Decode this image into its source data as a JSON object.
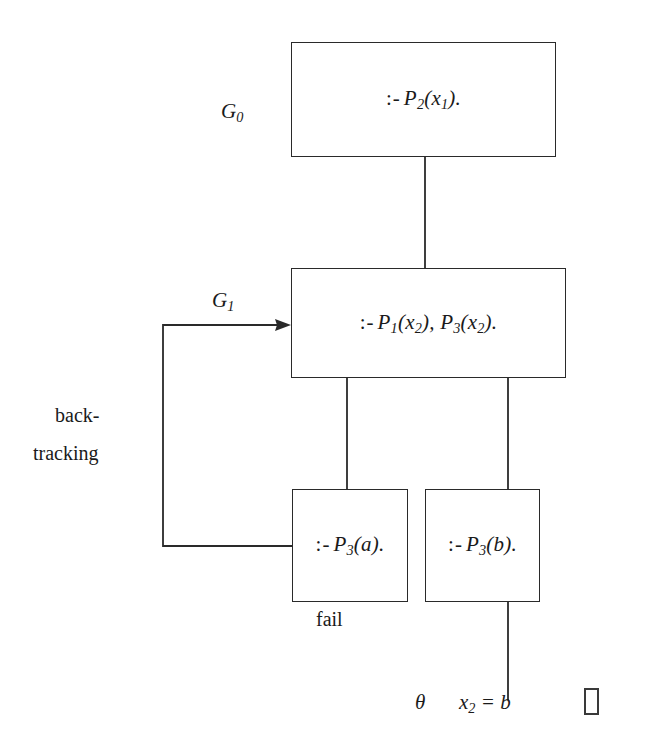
{
  "diagram": {
    "type": "sld-resolution-search-tree",
    "nodes": [
      {
        "id": "g0",
        "side_label": "G0",
        "side_label_base": "G",
        "side_label_sub": "0",
        "goal_op": ":-",
        "goal_body": "P2(x1).",
        "x": 291,
        "y": 42,
        "w": 265,
        "h": 115
      },
      {
        "id": "g1",
        "side_label": "G1",
        "side_label_base": "G",
        "side_label_sub": "1",
        "goal_op": ":-",
        "goal_body": "P1(x2), P3(x2).",
        "x": 291,
        "y": 268,
        "w": 275,
        "h": 110
      },
      {
        "id": "ga",
        "side_label": "",
        "goal_op": ":-",
        "goal_body": "P3(a).",
        "x": 292,
        "y": 489,
        "w": 116,
        "h": 113
      },
      {
        "id": "gb",
        "side_label": "",
        "goal_op": ":-",
        "goal_body": "P3(b).",
        "x": 425,
        "y": 489,
        "w": 115,
        "h": 113
      }
    ],
    "annotations": {
      "backtracking_line1": "back-",
      "backtracking_line2": "tracking",
      "fail": "fail",
      "theta": "θ",
      "substitution": "x2 = b",
      "box_glyph": "□"
    },
    "edges": [
      {
        "from": "g0",
        "to": "g1",
        "kind": "vertical"
      },
      {
        "from": "g1",
        "to": "ga",
        "kind": "vertical"
      },
      {
        "from": "g1",
        "to": "gb",
        "kind": "vertical"
      },
      {
        "from": "ga",
        "to": "g1",
        "kind": "backtrack-arrow"
      },
      {
        "from": "gb",
        "to": "answer",
        "kind": "vertical"
      }
    ]
  }
}
